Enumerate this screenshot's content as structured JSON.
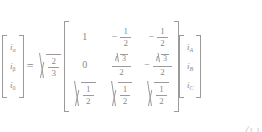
{
  "equation": {
    "name": "clarke-transformation",
    "relation": "=",
    "output_vector": {
      "label": "alpha-beta-zero-currents",
      "entries": [
        {
          "symbol": "i",
          "subscript": "α"
        },
        {
          "symbol": "i",
          "subscript": "β"
        },
        {
          "symbol": "i",
          "subscript": "0"
        }
      ]
    },
    "scalar_coefficient": {
      "label": "sqrt-two-thirds",
      "radical": true,
      "numerator": "2",
      "denominator": "3"
    },
    "matrix": {
      "label": "clarke-matrix",
      "rows": 3,
      "cols": 3,
      "cells": [
        [
          {
            "sign": "",
            "type": "integer",
            "value": "1"
          },
          {
            "sign": "−",
            "type": "fraction",
            "numerator": "1",
            "denominator": "2"
          },
          {
            "sign": "−",
            "type": "fraction",
            "numerator": "1",
            "denominator": "2"
          }
        ],
        [
          {
            "sign": "",
            "type": "integer",
            "value": "0"
          },
          {
            "sign": "",
            "type": "fraction",
            "numerator": "3",
            "numerator_radical": true,
            "denominator": "2"
          },
          {
            "sign": "−",
            "type": "fraction",
            "numerator": "3",
            "numerator_radical": true,
            "denominator": "2"
          }
        ],
        [
          {
            "sign": "",
            "type": "radical-fraction",
            "numerator": "1",
            "denominator": "2"
          },
          {
            "sign": "",
            "type": "radical-fraction",
            "numerator": "1",
            "denominator": "2"
          },
          {
            "sign": "",
            "type": "radical-fraction",
            "numerator": "1",
            "denominator": "2"
          }
        ]
      ]
    },
    "input_vector": {
      "label": "phase-currents",
      "entries": [
        {
          "symbol": "i",
          "subscript": "A"
        },
        {
          "symbol": "i",
          "subscript": "B"
        },
        {
          "symbol": "i",
          "subscript": "C"
        }
      ]
    },
    "clipped_fragment": "⎛1  1"
  },
  "style": {
    "text_color": "#8a8a8a",
    "rule_color": "#9a9a9a",
    "background": "#ffffff",
    "fragment_color": "#c8c8c8"
  }
}
